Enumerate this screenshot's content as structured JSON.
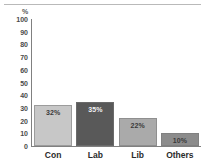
{
  "chart_data": {
    "type": "bar",
    "title": "",
    "subtitle": "",
    "xlabel": "",
    "ylabel": "%",
    "unit_label": "%",
    "categories": [
      "Con",
      "Lab",
      "Lib",
      "Others"
    ],
    "values": [
      32,
      35,
      22,
      10
    ],
    "data_labels": [
      "32%",
      "35%",
      "22%",
      "10%"
    ],
    "bar_colors": [
      "#c7c7c7",
      "#595959",
      "#aaaaaa",
      "#8c8c8c"
    ],
    "ylim": [
      0,
      100
    ],
    "yticks": [
      100,
      90,
      80,
      70,
      60,
      50,
      40,
      30,
      20,
      10,
      0
    ],
    "ytick_labels": [
      "100",
      "90",
      "80",
      "70",
      "60",
      "50",
      "40",
      "30",
      "20",
      "10",
      "0"
    ],
    "grid": false,
    "legend": null,
    "legend_position": "none",
    "axis_color": "#808080",
    "background": "#ffffff",
    "top_rule_color": "#b9b9b9"
  }
}
